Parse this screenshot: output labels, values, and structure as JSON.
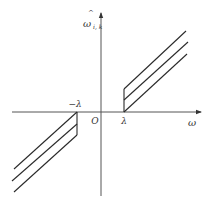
{
  "diagram": {
    "type": "piecewise-threshold-function",
    "axes": {
      "x_label": "ω",
      "y_label_main": "ω",
      "y_label_hat": "^",
      "y_label_sub": "i, k",
      "origin_label": "O"
    },
    "ticks": {
      "positive_threshold": "λ",
      "negative_threshold": "−λ"
    },
    "colors": {
      "line": "#2a2a2a",
      "axis": "#555555",
      "background": "#ffffff"
    },
    "geometry": {
      "origin": [
        101,
        112
      ],
      "x_axis": {
        "x1": 12,
        "x2": 201,
        "y": 112
      },
      "y_axis": {
        "x": 101,
        "y1": 196,
        "y2": 13
      },
      "right_branch": {
        "jump": {
          "x": 124,
          "y1": 112,
          "y2": 89
        },
        "lines": [
          {
            "x1": 124,
            "y1": 89,
            "x2": 186,
            "y2": 31
          },
          {
            "x1": 124,
            "y1": 100,
            "x2": 188,
            "y2": 42
          },
          {
            "x1": 124,
            "y1": 112,
            "x2": 187,
            "y2": 54
          }
        ]
      },
      "left_branch": {
        "jump": {
          "x": 77,
          "y1": 112,
          "y2": 135
        },
        "lines": [
          {
            "x1": 77,
            "y1": 112,
            "x2": 14,
            "y2": 169
          },
          {
            "x1": 77,
            "y1": 124,
            "x2": 12,
            "y2": 181
          },
          {
            "x1": 77,
            "y1": 135,
            "x2": 14,
            "y2": 192
          }
        ]
      }
    }
  }
}
